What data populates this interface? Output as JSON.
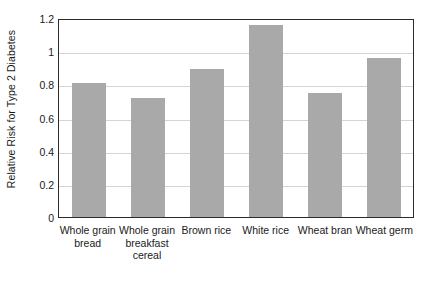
{
  "chart_data": {
    "type": "bar",
    "title": "",
    "xlabel": "",
    "ylabel": "Relative Risk for Type 2 Diabetes",
    "categories": [
      "Whole grain bread",
      "Whole grain breakfast cereal",
      "Brown rice",
      "White rice",
      "Wheat bran",
      "Wheat germ"
    ],
    "values": [
      0.81,
      0.72,
      0.89,
      1.16,
      0.75,
      0.96
    ],
    "ylim": [
      0,
      1.2
    ],
    "ytick_labels": [
      "0",
      "0.2",
      "0.4",
      "0.6",
      "0.8",
      "1",
      "1.2"
    ],
    "ytick_values": [
      0,
      0.2,
      0.4,
      0.6,
      0.8,
      1,
      1.2
    ],
    "grid": true,
    "legend": false,
    "bar_color": "#a9a9a9",
    "axis_color": "#2b2b2b",
    "gridline_color": "#d4d4d4",
    "background_color": "#ffffff"
  }
}
